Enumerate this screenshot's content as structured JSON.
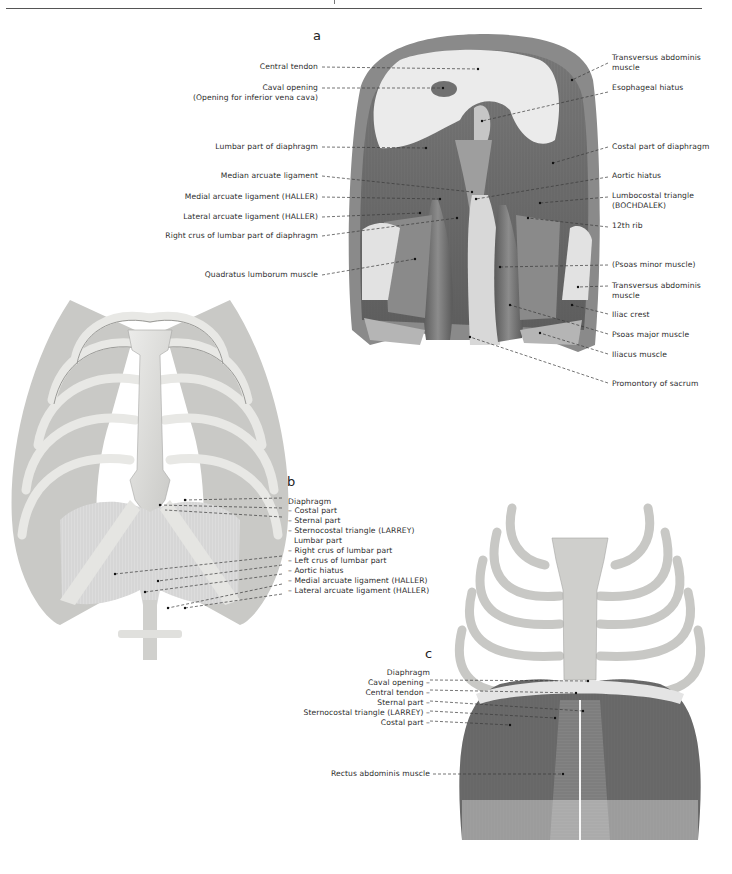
{
  "page": {
    "header_rule": true
  },
  "figures": {
    "a": {
      "letter": "a",
      "view": "Diaphragm viewed from below (abdominal view) with posterior abdominal wall",
      "labels_left": [
        "Central tendon",
        "Caval opening",
        "(Opening for inferior vena cava)",
        "Lumbar part of diaphragm",
        "Median arcuate ligament",
        "Medial arcuate ligament (HALLER)",
        "Lateral arcuate ligament (HALLER)",
        "Right crus of lumbar part of diaphragm",
        "Quadratus lumborum muscle"
      ],
      "labels_right": [
        "Transversus abdominis",
        "muscle",
        "Esophageal hiatus",
        "Costal part of diaphragm",
        "Aortic hiatus",
        "Lumbocostal triangle",
        "(BOCHDALEK)",
        "12th rib",
        "(Psoas minor muscle)",
        "Transversus abdominis",
        "muscle",
        "Iliac crest",
        "Psoas major muscle",
        "Iliacus muscle",
        "Promontory of sacrum"
      ]
    },
    "b": {
      "letter": "b",
      "view": "Thoracic cage, anterior view with diaphragm",
      "heading": "Diaphragm",
      "items": [
        "– Costal part",
        "– Sternal part",
        "– Sternocostal triangle (LARREY)",
        "Lumbar part",
        "– Right crus of lumbar part",
        "– Left crus of lumbar part",
        "– Aortic hiatus",
        "– Medial arcuate ligament (HALLER)",
        "– Lateral arcuate ligament (HALLER)"
      ]
    },
    "c": {
      "letter": "c",
      "view": "Anterior thoracic wall, posterior view with diaphragm",
      "heading": "Diaphragm",
      "items": [
        "Caval opening –",
        "Central tendon –",
        "Sternal part –",
        "Sternocostal triangle (LARREY) –",
        "Costal part –"
      ],
      "extra": "Rectus abdominis muscle"
    }
  },
  "colors": {
    "background": "#ffffff",
    "text": "#2c2c2c",
    "muscle_dark": "#6e6e6e",
    "muscle_mid": "#9a9a9a",
    "tendon_light": "#e8e8e8",
    "bone": "#d9d9d6"
  }
}
